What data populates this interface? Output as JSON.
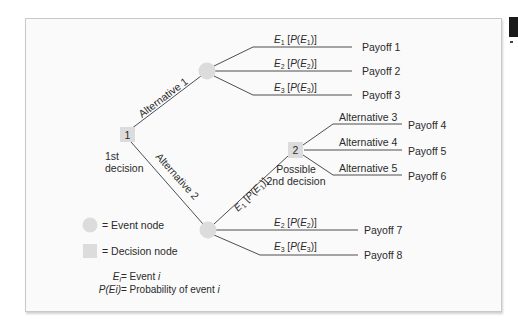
{
  "diagram": {
    "type": "decision-tree",
    "decision_nodes": [
      {
        "id": "1",
        "label": "1",
        "caption_lines": [
          "1st",
          "decision"
        ]
      },
      {
        "id": "2",
        "label": "2",
        "caption_lines": [
          "Possible",
          "2nd decision"
        ]
      }
    ],
    "branches": {
      "alternative_1": "Alternative 1",
      "alternative_2": "Alternative 2",
      "alternative_3": "Alternative 3",
      "alternative_4": "Alternative 4",
      "alternative_5": "Alternative 5"
    },
    "event_node_1": {
      "events": [
        {
          "e": "E",
          "sub": "1",
          "p_open": " [",
          "p": "P",
          "p_paren_open": "(",
          "inner": "E",
          "inner_sub": "1",
          "p_close": ")]"
        },
        {
          "e": "E",
          "sub": "2",
          "p_open": " [",
          "p": "P",
          "p_paren_open": "(",
          "inner": "E",
          "inner_sub": "2",
          "p_close": ")]"
        },
        {
          "e": "E",
          "sub": "3",
          "p_open": " [",
          "p": "P",
          "p_paren_open": "(",
          "inner": "E",
          "inner_sub": "3",
          "p_close": ")]"
        }
      ],
      "payoffs": [
        "Payoff 1",
        "Payoff 2",
        "Payoff 3"
      ]
    },
    "event_node_2": {
      "events": [
        {
          "e": "E",
          "sub": "1",
          "p_open": " [",
          "p": "P",
          "p_paren_open": "(",
          "inner": "E",
          "inner_sub": "1",
          "p_close": ")]"
        },
        {
          "e": "E",
          "sub": "2",
          "p_open": " [",
          "p": "P",
          "p_paren_open": "(",
          "inner": "E",
          "inner_sub": "2",
          "p_close": ")]"
        },
        {
          "e": "E",
          "sub": "3",
          "p_open": " [",
          "p": "P",
          "p_paren_open": "(",
          "inner": "E",
          "inner_sub": "3",
          "p_close": ")]"
        }
      ],
      "payoffs": [
        "Payoff 7",
        "Payoff 8"
      ]
    },
    "decision_2_payoffs": [
      "Payoff 4",
      "Payoff 5",
      "Payoff 6"
    ],
    "legend": {
      "event_node": "= Event node",
      "decision_node": "= Decision node",
      "ei_lhs_e": "E",
      "ei_lhs_i": "i",
      "ei_rhs": " = Event ",
      "ei_rhs_i": "i",
      "pei_lhs": "P(Ei)",
      "pei_rhs": " = Probability of event ",
      "pei_rhs_i": "i"
    },
    "colors": {
      "node_fill": "#dcdcdc",
      "line": "#3a3a3a",
      "frame_bg": "#fafafa",
      "frame_border": "#c9c9c9"
    }
  }
}
